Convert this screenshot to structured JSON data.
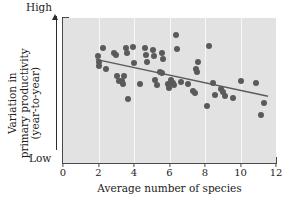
{
  "chart_data": {
    "type": "scatter",
    "title": "",
    "xlabel": "Average number of species",
    "ylabel": "Variation in primary productivity (year-to-year)",
    "ylabel_line1": "Variation in",
    "ylabel_line2": "primary productivity",
    "ylabel_line3": "(year-to-year)",
    "xlim": [
      0,
      12
    ],
    "ylim": [
      0,
      1
    ],
    "xticks": [
      0,
      2,
      4,
      6,
      8,
      10,
      12
    ],
    "xticklabels": [
      "0",
      "2",
      "4",
      "6",
      "8",
      "10",
      "12"
    ],
    "yticks": [],
    "yticklabels": [
      "Low",
      "High"
    ],
    "y_axis_low_label": "Low",
    "y_axis_high_label": "High",
    "y_axis_qualitative": true,
    "y_axis_arrow": "up",
    "grid": "vertical",
    "gridlines_x": [
      2,
      4,
      6,
      8,
      10
    ],
    "grid_color": "#f7f7f7",
    "plot_bgcolor": "#e2e2e2",
    "marker_color": "#5a5a5a",
    "marker_size": 6,
    "legend": null,
    "series": [
      {
        "name": "sites",
        "marker": "circle",
        "points": [
          [
            1.95,
            0.735
          ],
          [
            2.0,
            0.7
          ],
          [
            2.05,
            0.672
          ],
          [
            2.25,
            0.79
          ],
          [
            2.4,
            0.645
          ],
          [
            2.85,
            0.76
          ],
          [
            3.0,
            0.745
          ],
          [
            3.05,
            0.6
          ],
          [
            3.15,
            0.565
          ],
          [
            3.35,
            0.565
          ],
          [
            3.4,
            0.545
          ],
          [
            3.45,
            0.6
          ],
          [
            3.55,
            0.79
          ],
          [
            3.6,
            0.76
          ],
          [
            3.65,
            0.44
          ],
          [
            3.95,
            0.8
          ],
          [
            4.0,
            0.69
          ],
          [
            4.35,
            0.545
          ],
          [
            4.6,
            0.79
          ],
          [
            4.7,
            0.745
          ],
          [
            4.75,
            0.7
          ],
          [
            5.05,
            0.78
          ],
          [
            5.15,
            0.74
          ],
          [
            5.2,
            0.575
          ],
          [
            5.3,
            0.54
          ],
          [
            5.45,
            0.625
          ],
          [
            5.55,
            0.62
          ],
          [
            5.6,
            0.76
          ],
          [
            5.65,
            0.715
          ],
          [
            5.9,
            0.545
          ],
          [
            5.95,
            0.52
          ],
          [
            6.1,
            0.575
          ],
          [
            6.2,
            0.555
          ],
          [
            6.25,
            0.54
          ],
          [
            6.35,
            0.885
          ],
          [
            6.4,
            0.785
          ],
          [
            6.65,
            0.56
          ],
          [
            7.05,
            0.545
          ],
          [
            7.35,
            0.5
          ],
          [
            7.45,
            0.48
          ],
          [
            7.5,
            0.65
          ],
          [
            7.55,
            0.625
          ],
          [
            7.6,
            0.7
          ],
          [
            8.1,
            0.39
          ],
          [
            8.25,
            0.805
          ],
          [
            8.45,
            0.555
          ],
          [
            8.55,
            0.47
          ],
          [
            8.9,
            0.51
          ],
          [
            9.0,
            0.49
          ],
          [
            9.1,
            0.465
          ],
          [
            9.55,
            0.45
          ],
          [
            10.05,
            0.565
          ],
          [
            10.85,
            0.555
          ],
          [
            11.15,
            0.33
          ],
          [
            11.3,
            0.415
          ]
        ]
      }
    ],
    "trendline": {
      "type": "linear",
      "x_start": 1.85,
      "y_start": 0.715,
      "x_end": 11.55,
      "y_end": 0.46,
      "color": "#5a5a5a",
      "width": 1.4
    }
  }
}
